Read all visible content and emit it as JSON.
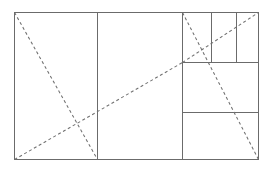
{
  "figure": {
    "background_color": "#ffffff",
    "line_color": "#6b6b6b",
    "dashed_line_color": "#707070",
    "canvas": {
      "width": 274,
      "height": 173
    }
  },
  "chart_data": {
    "type": "diagram",
    "subtitle": "",
    "xlabel": "",
    "ylabel": "",
    "grid": false,
    "legend": "none",
    "xlim": [
      0,
      274
    ],
    "ylim": [
      0,
      173
    ],
    "outer_rectangle": {
      "name": "outer-frame",
      "x": 14,
      "y": 12,
      "width": 244,
      "height": 147,
      "style": "solid"
    },
    "vertical_dividers": [
      {
        "name": "divider-square-1",
        "x": 97,
        "y1": 12,
        "y2": 159,
        "style": "solid"
      },
      {
        "name": "divider-square-2",
        "x": 182,
        "y1": 12,
        "y2": 159,
        "style": "solid"
      },
      {
        "name": "divider-small-1",
        "x": 211,
        "y1": 12,
        "y2": 62,
        "style": "solid"
      },
      {
        "name": "divider-small-2",
        "x": 236,
        "y1": 12,
        "y2": 62,
        "style": "solid"
      }
    ],
    "horizontal_dividers": [
      {
        "name": "divider-upper",
        "y": 62,
        "x1": 182,
        "x2": 258,
        "style": "solid"
      },
      {
        "name": "divider-lower",
        "y": 112,
        "x1": 182,
        "x2": 258,
        "style": "solid"
      }
    ],
    "diagonals": [
      {
        "name": "diagonal-main-descending",
        "x1": 14,
        "y1": 12,
        "x2": 97,
        "y2": 159,
        "style": "dashed"
      },
      {
        "name": "diagonal-main-ascending",
        "x1": 14,
        "y1": 159,
        "x2": 182,
        "y2": 62,
        "style": "dashed"
      },
      {
        "name": "diagonal-right-ascending",
        "x1": 182,
        "y1": 62,
        "x2": 258,
        "y2": 12,
        "style": "dashed"
      },
      {
        "name": "diagonal-right-descending",
        "x1": 182,
        "y1": 12,
        "x2": 258,
        "y2": 159,
        "style": "dashed"
      }
    ]
  }
}
